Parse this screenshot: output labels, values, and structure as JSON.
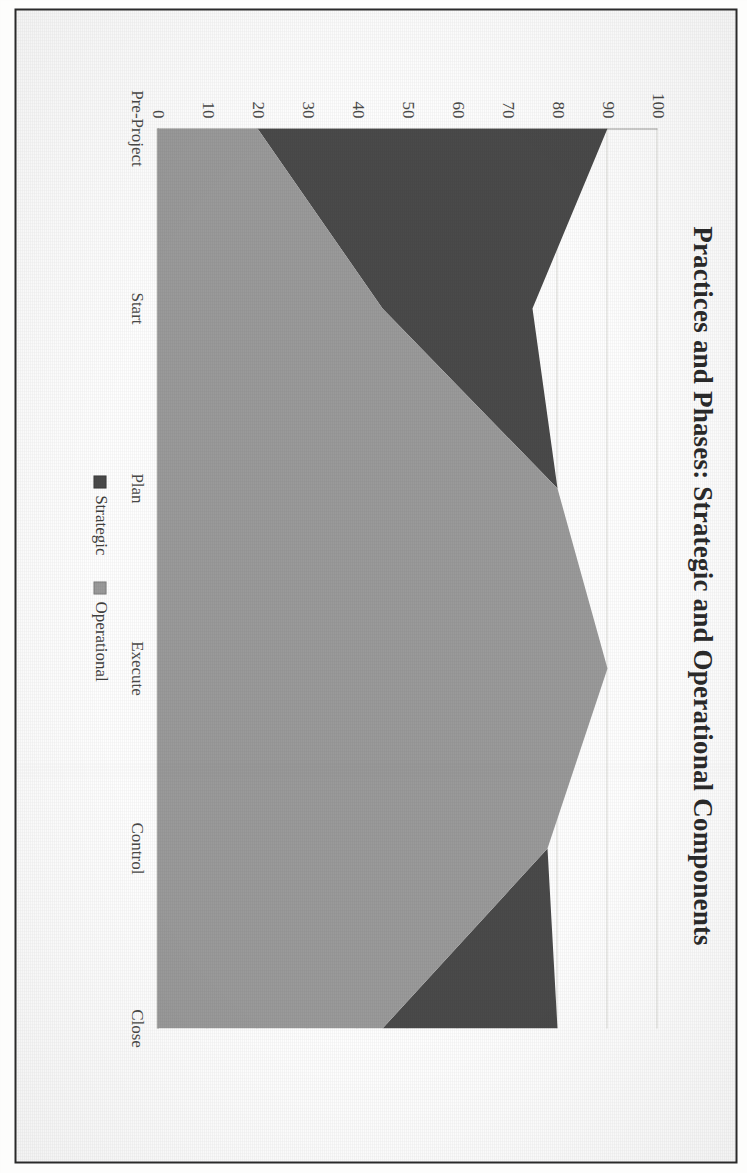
{
  "figure": {
    "title": "Practices and Phases: Strategic and Operational Components",
    "frame_border_color": "#2a2a2a",
    "background": "#fefefe",
    "rotation_note_deg": 90
  },
  "legend": {
    "items": [
      {
        "label": "Strategic",
        "color": "#4a4a4a",
        "swatch_icon": "square-swatch-icon"
      },
      {
        "label": "Operational",
        "color": "#9a9a9a",
        "swatch_icon": "square-swatch-icon"
      }
    ]
  },
  "axes": {
    "y_ticks": [
      "100",
      "90",
      "80",
      "70",
      "60",
      "50",
      "40",
      "30",
      "20",
      "10",
      "0"
    ],
    "x_ticks": [
      "Pre-Project",
      "Start",
      "Plan",
      "Execute",
      "Control",
      "Close"
    ]
  },
  "chart_data": {
    "type": "area",
    "stacked": true,
    "title": "Practices and Phases: Strategic and Operational Components",
    "xlabel": "",
    "ylabel": "",
    "categories": [
      "Pre-Project",
      "Start",
      "Plan",
      "Execute",
      "Control",
      "Close"
    ],
    "series": [
      {
        "name": "Operational",
        "color": "#9a9a9a",
        "values": [
          20,
          45,
          80,
          90,
          78,
          45
        ]
      },
      {
        "name": "Strategic",
        "color": "#4a4a4a",
        "values": [
          70,
          30,
          0,
          0,
          0,
          35
        ]
      }
    ],
    "stack_order": [
      "Operational",
      "Strategic"
    ],
    "totals": [
      90,
      75,
      80,
      90,
      78,
      80
    ],
    "ylim": [
      0,
      100
    ],
    "ytick_step": 10,
    "grid": "horizontal-only",
    "legend_position": "bottom-center"
  }
}
